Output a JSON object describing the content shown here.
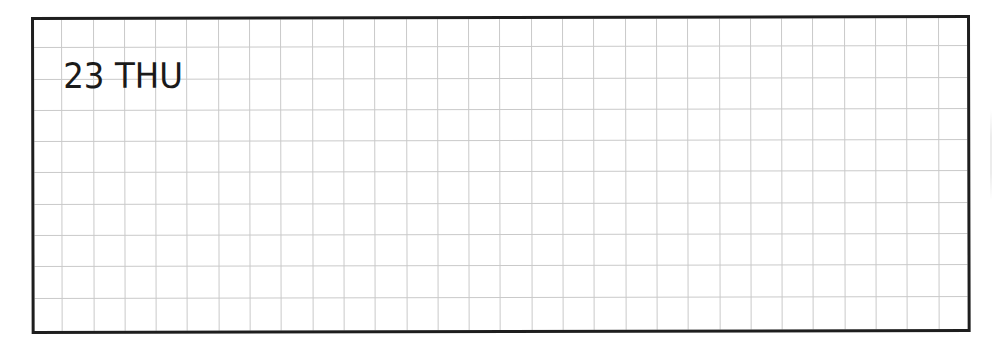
{
  "planner": {
    "date_label": "23 THU",
    "day_number": "23",
    "weekday": "THU",
    "grid": {
      "type": "square-grid",
      "cell_size_px": 31,
      "line_color": "#c9c9c9"
    },
    "border_color": "#1e1e1e",
    "text_color": "#1a1a1a"
  }
}
